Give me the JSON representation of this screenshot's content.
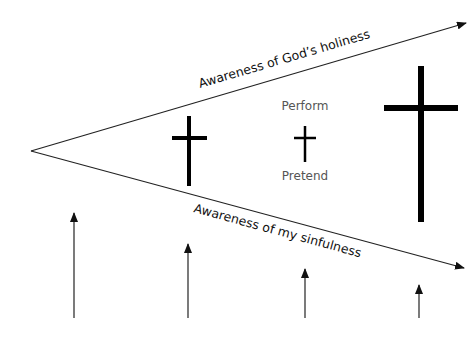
{
  "diagram": {
    "upper_arrow_label": "Awareness of God’s holiness",
    "lower_arrow_label": "Awareness of my sinfulness",
    "middle_labels": {
      "top": "Perform",
      "bottom": "Pretend"
    },
    "crosses": [
      {
        "name": "cross-small-left",
        "relative_size": "medium"
      },
      {
        "name": "cross-tiny-middle",
        "relative_size": "small"
      },
      {
        "name": "cross-large-right",
        "relative_size": "large"
      }
    ],
    "up_arrows": [
      {
        "name": "up-arrow-1",
        "relative_length": 1.0
      },
      {
        "name": "up-arrow-2",
        "relative_length": 0.7
      },
      {
        "name": "up-arrow-3",
        "relative_length": 0.46
      },
      {
        "name": "up-arrow-4",
        "relative_length": 0.3
      }
    ],
    "colors": {
      "ink": "#111111",
      "label_gray": "#555555",
      "background": "#ffffff"
    }
  }
}
